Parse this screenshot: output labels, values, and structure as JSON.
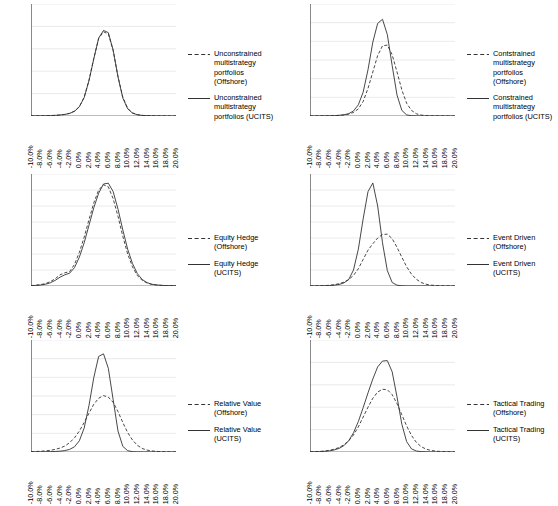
{
  "figure": {
    "layout": "2 columns x 3 rows of line charts",
    "x_axis": {
      "label": "",
      "categories": [
        "-10.0%",
        "-8.0%",
        "-6.0%",
        "-4.0%",
        "-2.0%",
        "0.0%",
        "2.0%",
        "4.0%",
        "6.0%",
        "8.0%",
        "10.0%",
        "12.0%",
        "14.0%",
        "16.0%",
        "18.0%",
        "20.0%"
      ],
      "min": -10.0,
      "max": 20.0,
      "step": 2.0,
      "minor_ticks": true,
      "tick_label_rotation": -90
    },
    "series_style": {
      "offshore": "dashed",
      "ucits": "solid",
      "color": "#333333"
    }
  },
  "chart_data": [
    {
      "id": "unconstrained-multistrategy",
      "type": "line",
      "title": "",
      "xlabel": "",
      "ylabel": "",
      "grid": true,
      "legend_position": "right",
      "ylim": [
        0,
        2500
      ],
      "yticks": [
        0,
        500,
        1000,
        1500,
        2000,
        2500
      ],
      "x": [
        -10.0,
        -9.0,
        -8.0,
        -7.0,
        -6.0,
        -5.0,
        -4.0,
        -3.0,
        -2.0,
        -1.0,
        0.0,
        1.0,
        2.0,
        3.0,
        4.0,
        5.0,
        6.0,
        7.0,
        8.0,
        9.0,
        10.0,
        11.0,
        12.0,
        13.0,
        14.0,
        15.0,
        16.0,
        17.0,
        18.0,
        19.0,
        20.0
      ],
      "series": [
        {
          "name": "Unconstrained multistrategy portfolios (Offshore)",
          "style": "dashed",
          "values": [
            2,
            3,
            4,
            6,
            9,
            14,
            22,
            35,
            60,
            110,
            210,
            420,
            800,
            1290,
            1730,
            1880,
            1830,
            1460,
            880,
            420,
            170,
            70,
            30,
            14,
            8,
            5,
            3,
            2,
            2,
            1,
            1
          ]
        },
        {
          "name": "Unconstrained multistrategy portfolios (UCITS)",
          "style": "solid",
          "values": [
            2,
            3,
            4,
            6,
            9,
            14,
            22,
            35,
            58,
            105,
            205,
            410,
            790,
            1280,
            1740,
            1910,
            1860,
            1470,
            870,
            400,
            160,
            65,
            28,
            13,
            7,
            4,
            3,
            2,
            1,
            1,
            1
          ]
        }
      ]
    },
    {
      "id": "constrained-multistrategy",
      "type": "line",
      "title": "",
      "xlabel": "",
      "ylabel": "",
      "grid": true,
      "legend_position": "right",
      "ylim": [
        0,
        3000
      ],
      "yticks": [
        0,
        500,
        1000,
        1500,
        2000,
        2500,
        3000
      ],
      "x": [
        -10.0,
        -9.0,
        -8.0,
        -7.0,
        -6.0,
        -5.0,
        -4.0,
        -3.0,
        -2.0,
        -1.0,
        0.0,
        1.0,
        2.0,
        3.0,
        4.0,
        5.0,
        6.0,
        7.0,
        8.0,
        9.0,
        10.0,
        11.0,
        12.0,
        13.0,
        14.0,
        15.0,
        16.0,
        17.0,
        18.0,
        19.0,
        20.0
      ],
      "series": [
        {
          "name": "Contstrained multistrategy portfoilos (Offshore)",
          "style": "dashed",
          "values": [
            1,
            2,
            3,
            4,
            6,
            10,
            16,
            28,
            50,
            95,
            190,
            390,
            740,
            1180,
            1620,
            1880,
            1900,
            1640,
            1180,
            700,
            340,
            150,
            60,
            25,
            12,
            6,
            4,
            2,
            2,
            1,
            1
          ]
        },
        {
          "name": "Constrained multistrategy portfolios (UCITS)",
          "style": "solid",
          "values": [
            1,
            2,
            3,
            4,
            6,
            10,
            18,
            32,
            62,
            135,
            300,
            640,
            1240,
            1980,
            2480,
            2590,
            2180,
            1350,
            560,
            150,
            30,
            8,
            3,
            2,
            1,
            1,
            1,
            1,
            1,
            0,
            0
          ]
        }
      ]
    },
    {
      "id": "equity-hedge",
      "type": "line",
      "title": "",
      "xlabel": "",
      "ylabel": "",
      "grid": true,
      "legend_position": "right",
      "ylim": [
        0,
        1400
      ],
      "yticks": [
        0,
        200,
        400,
        600,
        800,
        1000,
        1200,
        1400
      ],
      "x": [
        -10.0,
        -9.0,
        -8.0,
        -7.0,
        -6.0,
        -5.0,
        -4.0,
        -3.0,
        -2.0,
        -1.0,
        0.0,
        1.0,
        2.0,
        3.0,
        4.0,
        5.0,
        6.0,
        7.0,
        8.0,
        9.0,
        10.0,
        11.0,
        12.0,
        13.0,
        14.0,
        15.0,
        16.0,
        17.0,
        18.0,
        19.0,
        20.0
      ],
      "series": [
        {
          "name": "Equity Hedge (Offshore)",
          "style": "dashed",
          "values": [
            5,
            10,
            18,
            30,
            55,
            90,
            140,
            165,
            180,
            270,
            420,
            610,
            830,
            1040,
            1200,
            1265,
            1240,
            1090,
            870,
            620,
            400,
            240,
            130,
            70,
            38,
            20,
            12,
            8,
            5,
            4,
            3
          ]
        },
        {
          "name": "Equity Hedge (UCITS)",
          "style": "solid",
          "values": [
            4,
            7,
            12,
            22,
            40,
            70,
            110,
            140,
            160,
            230,
            360,
            540,
            760,
            980,
            1160,
            1275,
            1285,
            1180,
            960,
            700,
            460,
            280,
            155,
            82,
            42,
            22,
            13,
            8,
            5,
            4,
            3
          ]
        }
      ]
    },
    {
      "id": "event-driven",
      "type": "line",
      "title": "",
      "xlabel": "",
      "ylabel": "",
      "grid": true,
      "legend_position": "right",
      "ylim": [
        0,
        3500
      ],
      "yticks": [
        0,
        500,
        1000,
        1500,
        2000,
        2500,
        3000,
        3500
      ],
      "x": [
        -10.0,
        -9.0,
        -8.0,
        -7.0,
        -6.0,
        -5.0,
        -4.0,
        -3.0,
        -2.0,
        -1.0,
        0.0,
        1.0,
        2.0,
        3.0,
        4.0,
        5.0,
        6.0,
        7.0,
        8.0,
        9.0,
        10.0,
        11.0,
        12.0,
        13.0,
        14.0,
        15.0,
        16.0,
        17.0,
        18.0,
        19.0,
        20.0
      ],
      "series": [
        {
          "name": "Event Driven (Offshore)",
          "style": "dashed",
          "values": [
            2,
            4,
            7,
            12,
            22,
            40,
            70,
            120,
            200,
            330,
            540,
            830,
            1120,
            1320,
            1500,
            1610,
            1620,
            1480,
            1210,
            900,
            600,
            370,
            210,
            110,
            55,
            28,
            15,
            8,
            5,
            3,
            2
          ]
        },
        {
          "name": "Event Driven (UCITS)",
          "style": "solid",
          "values": [
            2,
            3,
            5,
            8,
            14,
            26,
            48,
            95,
            200,
            500,
            1150,
            2100,
            2950,
            3220,
            2500,
            1350,
            480,
            110,
            25,
            8,
            3,
            2,
            1,
            1,
            1,
            0,
            0,
            0,
            0,
            0,
            0
          ]
        }
      ]
    },
    {
      "id": "relative-value",
      "type": "line",
      "title": "",
      "xlabel": "",
      "ylabel": "",
      "grid": true,
      "legend_position": "right",
      "ylim": [
        0,
        3000
      ],
      "yticks": [
        0,
        500,
        1000,
        1500,
        2000,
        2500,
        3000
      ],
      "x": [
        -10.0,
        -9.0,
        -8.0,
        -7.0,
        -6.0,
        -5.0,
        -4.0,
        -3.0,
        -2.0,
        -1.0,
        0.0,
        1.0,
        2.0,
        3.0,
        4.0,
        5.0,
        6.0,
        7.0,
        8.0,
        9.0,
        10.0,
        11.0,
        12.0,
        13.0,
        14.0,
        15.0,
        16.0,
        17.0,
        18.0,
        19.0,
        20.0
      ],
      "series": [
        {
          "name": "Relative Value (Offshore)",
          "style": "dashed",
          "values": [
            10,
            14,
            20,
            30,
            45,
            70,
            105,
            160,
            250,
            380,
            560,
            790,
            1040,
            1280,
            1440,
            1510,
            1470,
            1330,
            1080,
            790,
            520,
            320,
            180,
            95,
            50,
            28,
            16,
            10,
            6,
            4,
            3
          ]
        },
        {
          "name": "Relative Value (UCITS)",
          "style": "solid",
          "values": [
            2,
            3,
            4,
            6,
            9,
            14,
            22,
            38,
            70,
            140,
            300,
            640,
            1250,
            2000,
            2560,
            2630,
            2240,
            1400,
            560,
            150,
            35,
            10,
            4,
            2,
            1,
            1,
            1,
            0,
            0,
            0,
            0
          ]
        }
      ]
    },
    {
      "id": "tactical-trading",
      "type": "line",
      "title": "",
      "xlabel": "",
      "ylabel": "",
      "grid": true,
      "legend_position": "right",
      "ylim": [
        0,
        2500
      ],
      "yticks": [
        0,
        500,
        1000,
        1500,
        2000,
        2500
      ],
      "x": [
        -10.0,
        -9.0,
        -8.0,
        -7.0,
        -6.0,
        -5.0,
        -4.0,
        -3.0,
        -2.0,
        -1.0,
        0.0,
        1.0,
        2.0,
        3.0,
        4.0,
        5.0,
        6.0,
        7.0,
        8.0,
        9.0,
        10.0,
        11.0,
        12.0,
        13.0,
        14.0,
        15.0,
        16.0,
        17.0,
        18.0,
        19.0,
        20.0
      ],
      "series": [
        {
          "name": "Tactical Trading (Offshore)",
          "style": "dashed",
          "values": [
            5,
            8,
            13,
            22,
            38,
            62,
            100,
            160,
            250,
            380,
            560,
            780,
            1000,
            1200,
            1340,
            1400,
            1390,
            1280,
            1080,
            830,
            580,
            370,
            215,
            120,
            65,
            35,
            20,
            12,
            8,
            5,
            4
          ]
        },
        {
          "name": "Tactical Trading (UCITS)",
          "style": "solid",
          "values": [
            3,
            5,
            8,
            14,
            25,
            45,
            80,
            140,
            250,
            430,
            680,
            990,
            1320,
            1630,
            1900,
            2030,
            2040,
            1790,
            1230,
            620,
            230,
            70,
            22,
            9,
            4,
            2,
            1,
            1,
            1,
            0,
            0
          ]
        }
      ]
    }
  ]
}
